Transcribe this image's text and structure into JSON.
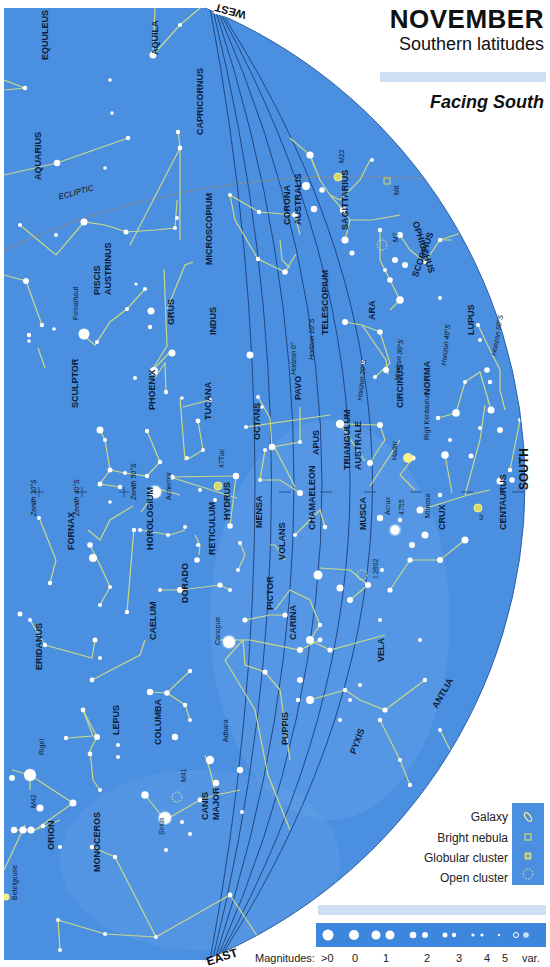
{
  "header": {
    "title": "NOVEMBER",
    "subtitle": "Southern latitudes",
    "facing": "Facing South"
  },
  "directions": {
    "west": "WEST",
    "east": "EAST",
    "south": "SOUTH"
  },
  "colors": {
    "sky": "#4a8fe0",
    "sky_light": "#6aa6ea",
    "constellation_line": "#c9d98a",
    "horizon_line": "#1b3f7a",
    "ecliptic": "#8a8a8a",
    "band": "#cfe0f4",
    "star": "#ffffff",
    "yellow_star": "#f5f08a"
  },
  "ecliptic_label": "ECLIPTIC",
  "horizon_labels": [
    "Horizon 0°",
    "Horizon 10°S",
    "Horizon 20°S",
    "Horizon 30°S",
    "Horizon 40°S",
    "Horizon 50°S"
  ],
  "zenith_labels": [
    "Zenith 30°S",
    "Zenith 40°S",
    "Zenith 50°S"
  ],
  "constellations": [
    {
      "name": "EQUULEUS",
      "x": 40,
      "y": 60,
      "rot": -90
    },
    {
      "name": "AQUILA",
      "x": 150,
      "y": 55,
      "rot": -90
    },
    {
      "name": "CAPRICORNUS",
      "x": 195,
      "y": 135,
      "rot": -90
    },
    {
      "name": "AQUARIUS",
      "x": 33,
      "y": 180,
      "rot": -90
    },
    {
      "name": "PISCIS",
      "x": 92,
      "y": 295,
      "rot": -90
    },
    {
      "name": "AUSTRINUS",
      "x": 103,
      "y": 295,
      "rot": -90
    },
    {
      "name": "MICROSCOPIUM",
      "x": 204,
      "y": 265,
      "rot": -90
    },
    {
      "name": "GRUS",
      "x": 166,
      "y": 325,
      "rot": -90
    },
    {
      "name": "INDUS",
      "x": 208,
      "y": 335,
      "rot": -90
    },
    {
      "name": "CORONA",
      "x": 282,
      "y": 225,
      "rot": -90
    },
    {
      "name": "AUSTRALIS",
      "x": 293,
      "y": 225,
      "rot": -90
    },
    {
      "name": "SAGITTARIUS",
      "x": 340,
      "y": 230,
      "rot": -90
    },
    {
      "name": "OPHIUCHUS",
      "x": 420,
      "y": 220,
      "rot": 72
    },
    {
      "name": "SCORPIUS",
      "x": 410,
      "y": 275,
      "rot": -70
    },
    {
      "name": "TELESCOPIUM",
      "x": 320,
      "y": 335,
      "rot": -90
    },
    {
      "name": "ARA",
      "x": 367,
      "y": 320,
      "rot": -90
    },
    {
      "name": "LUPUS",
      "x": 466,
      "y": 335,
      "rot": -90
    },
    {
      "name": "NORMA",
      "x": 422,
      "y": 395,
      "rot": -90
    },
    {
      "name": "SCULPTOR",
      "x": 70,
      "y": 408,
      "rot": -90
    },
    {
      "name": "PHOENIX",
      "x": 147,
      "y": 410,
      "rot": -90
    },
    {
      "name": "TUCANA",
      "x": 203,
      "y": 420,
      "rot": -90
    },
    {
      "name": "OCTANS",
      "x": 252,
      "y": 440,
      "rot": -90
    },
    {
      "name": "PAVO",
      "x": 293,
      "y": 400,
      "rot": -90
    },
    {
      "name": "CIRCINUS",
      "x": 395,
      "y": 408,
      "rot": -90
    },
    {
      "name": "APUS",
      "x": 311,
      "y": 455,
      "rot": -90
    },
    {
      "name": "TRIANGULUM",
      "x": 342,
      "y": 470,
      "rot": -90
    },
    {
      "name": "AUSTRALE",
      "x": 353,
      "y": 470,
      "rot": -90
    },
    {
      "name": "HYDRUS",
      "x": 222,
      "y": 520,
      "rot": -90
    },
    {
      "name": "MENSA",
      "x": 254,
      "y": 528,
      "rot": -90
    },
    {
      "name": "FORNAX",
      "x": 66,
      "y": 550,
      "rot": -90
    },
    {
      "name": "HOROLOGIUM",
      "x": 145,
      "y": 550,
      "rot": -90
    },
    {
      "name": "RETICULUM",
      "x": 207,
      "y": 555,
      "rot": -90
    },
    {
      "name": "CHAMAELEON",
      "x": 307,
      "y": 530,
      "rot": -90
    },
    {
      "name": "VOLANS",
      "x": 277,
      "y": 560,
      "rot": -90
    },
    {
      "name": "MUSCA",
      "x": 358,
      "y": 530,
      "rot": -90
    },
    {
      "name": "CRUX",
      "x": 437,
      "y": 530,
      "rot": -90
    },
    {
      "name": "CENTAURUS",
      "x": 498,
      "y": 530,
      "rot": -90
    },
    {
      "name": "DORADO",
      "x": 180,
      "y": 603,
      "rot": -90
    },
    {
      "name": "CAELUM",
      "x": 148,
      "y": 640,
      "rot": -90
    },
    {
      "name": "PICTOR",
      "x": 265,
      "y": 610,
      "rot": -90
    },
    {
      "name": "CARINA",
      "x": 288,
      "y": 640,
      "rot": -90
    },
    {
      "name": "VELA",
      "x": 376,
      "y": 662,
      "rot": -90
    },
    {
      "name": "ERIDANUS",
      "x": 34,
      "y": 670,
      "rot": -90
    },
    {
      "name": "ANTLIA",
      "x": 430,
      "y": 705,
      "rot": -60
    },
    {
      "name": "LEPUS",
      "x": 111,
      "y": 735,
      "rot": -90
    },
    {
      "name": "COLUMBA",
      "x": 153,
      "y": 745,
      "rot": -90
    },
    {
      "name": "PUPPIS",
      "x": 280,
      "y": 745,
      "rot": -90
    },
    {
      "name": "PYXIS",
      "x": 348,
      "y": 752,
      "rot": -70
    },
    {
      "name": "ORION",
      "x": 46,
      "y": 850,
      "rot": -90
    },
    {
      "name": "CANIS",
      "x": 200,
      "y": 820,
      "rot": -90
    },
    {
      "name": "MAJOR",
      "x": 211,
      "y": 820,
      "rot": -90
    },
    {
      "name": "MONOCEROS",
      "x": 92,
      "y": 872,
      "rot": -90
    }
  ],
  "named_objects": [
    {
      "name": "Fomalhaut",
      "x": 72,
      "y": 320
    },
    {
      "name": "Achernar",
      "x": 165,
      "y": 500
    },
    {
      "name": "47Tuc",
      "x": 218,
      "y": 468
    },
    {
      "name": "M22",
      "x": 338,
      "y": 163
    },
    {
      "name": "M8",
      "x": 393,
      "y": 195
    },
    {
      "name": "M7",
      "x": 392,
      "y": 242
    },
    {
      "name": "Hadar",
      "x": 391,
      "y": 460
    },
    {
      "name": "Rigil Kentaurus",
      "x": 423,
      "y": 440
    },
    {
      "name": "Acrux",
      "x": 384,
      "y": 515
    },
    {
      "name": "4755",
      "x": 398,
      "y": 515
    },
    {
      "name": "Mimosa",
      "x": 424,
      "y": 518
    },
    {
      "name": "ω",
      "x": 477,
      "y": 520
    },
    {
      "name": "I.2602",
      "x": 372,
      "y": 578
    },
    {
      "name": "Canopus",
      "x": 214,
      "y": 645
    },
    {
      "name": "Adhara",
      "x": 222,
      "y": 742
    },
    {
      "name": "M41",
      "x": 180,
      "y": 782
    },
    {
      "name": "Rigel",
      "x": 38,
      "y": 755
    },
    {
      "name": "M42",
      "x": 30,
      "y": 808
    },
    {
      "name": "Sirius",
      "x": 158,
      "y": 835
    },
    {
      "name": "Betelgeuse",
      "x": 11,
      "y": 900
    }
  ],
  "legend": {
    "items": [
      {
        "label": "Galaxy",
        "icon": "galaxy-icon"
      },
      {
        "label": "Bright nebula",
        "icon": "nebula-icon"
      },
      {
        "label": "Globular cluster",
        "icon": "globular-cluster-icon"
      },
      {
        "label": "Open cluster",
        "icon": "open-cluster-icon"
      }
    ]
  },
  "magnitudes": {
    "label": "Magnitudes:",
    "scale": [
      ">0",
      "0",
      "1",
      "2",
      "3",
      "4",
      "5",
      "var."
    ]
  }
}
